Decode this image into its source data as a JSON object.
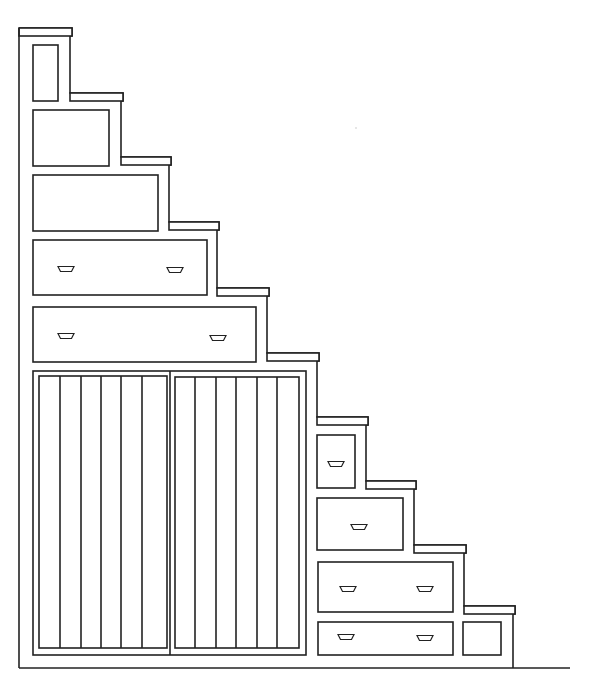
{
  "colors": {
    "line": "#222222",
    "background": "#ffffff"
  },
  "wall": {
    "x": 19,
    "y1": 28,
    "y2": 668
  },
  "floor": {
    "x1": 19,
    "x2": 570,
    "y": 668
  },
  "profile": [
    [
      19,
      28
    ],
    [
      72,
      28
    ],
    [
      72,
      36
    ],
    [
      70,
      36
    ],
    [
      70,
      93
    ],
    [
      123,
      93
    ],
    [
      123,
      101
    ],
    [
      121,
      101
    ],
    [
      121,
      157
    ],
    [
      171,
      157
    ],
    [
      171,
      165
    ],
    [
      169,
      165
    ],
    [
      169,
      222
    ],
    [
      219,
      222
    ],
    [
      219,
      230
    ],
    [
      217,
      230
    ],
    [
      217,
      288
    ],
    [
      269,
      288
    ],
    [
      269,
      296
    ],
    [
      267,
      296
    ],
    [
      267,
      353
    ],
    [
      319,
      353
    ],
    [
      319,
      361
    ],
    [
      317,
      361
    ],
    [
      317,
      417
    ],
    [
      368,
      417
    ],
    [
      368,
      425
    ],
    [
      366,
      425
    ],
    [
      366,
      481
    ],
    [
      416,
      481
    ],
    [
      416,
      489
    ],
    [
      414,
      489
    ],
    [
      414,
      545
    ],
    [
      466,
      545
    ],
    [
      466,
      553
    ],
    [
      464,
      553
    ],
    [
      464,
      606
    ],
    [
      515,
      606
    ],
    [
      515,
      614
    ],
    [
      513,
      614
    ],
    [
      513,
      668
    ]
  ],
  "treads": [
    [
      19,
      28,
      72,
      36
    ],
    [
      70,
      93,
      123,
      101
    ],
    [
      121,
      157,
      171,
      165
    ],
    [
      169,
      222,
      219,
      230
    ],
    [
      217,
      288,
      269,
      296
    ],
    [
      267,
      353,
      319,
      361
    ],
    [
      317,
      417,
      368,
      425
    ],
    [
      366,
      481,
      416,
      489
    ],
    [
      414,
      545,
      466,
      553
    ],
    [
      464,
      606,
      515,
      614
    ]
  ],
  "panels": [
    {
      "name": "top-cabinet-door",
      "x": 33,
      "y": 45,
      "w": 25,
      "h": 56,
      "handles": []
    },
    {
      "name": "drawer-2",
      "x": 33,
      "y": 110,
      "w": 76,
      "h": 56,
      "handles": []
    },
    {
      "name": "drawer-3",
      "x": 33,
      "y": 175,
      "w": 125,
      "h": 56,
      "handles": []
    },
    {
      "name": "drawer-4",
      "x": 33,
      "y": 240,
      "w": 174,
      "h": 55,
      "handles": [
        [
          66,
          269
        ],
        [
          175,
          270
        ]
      ]
    },
    {
      "name": "drawer-5",
      "x": 33,
      "y": 307,
      "w": 223,
      "h": 55,
      "handles": [
        [
          66,
          336
        ],
        [
          218,
          338
        ]
      ]
    },
    {
      "name": "right-drawer-1",
      "x": 317,
      "y": 435,
      "w": 38,
      "h": 53,
      "handles": [
        [
          336,
          464
        ]
      ]
    },
    {
      "name": "right-drawer-2",
      "x": 317,
      "y": 498,
      "w": 86,
      "h": 52,
      "handles": [
        [
          359,
          527
        ]
      ]
    },
    {
      "name": "right-drawer-3",
      "x": 318,
      "y": 562,
      "w": 135,
      "h": 50,
      "handles": [
        [
          348,
          589
        ],
        [
          425,
          589
        ]
      ]
    },
    {
      "name": "right-drawer-4",
      "x": 318,
      "y": 622,
      "w": 135,
      "h": 33,
      "handles": [
        [
          346,
          637
        ],
        [
          425,
          638
        ]
      ]
    },
    {
      "name": "small-end-door",
      "x": 463,
      "y": 622,
      "w": 38,
      "h": 33,
      "handles": []
    }
  ],
  "sliding_doors": {
    "frame": {
      "x": 33,
      "y": 371,
      "w": 273,
      "h": 284
    },
    "doors": [
      {
        "name": "left-sliding-door",
        "x": 39,
        "y": 376,
        "w": 128,
        "h": 272,
        "slats": [
          60,
          81,
          101,
          121,
          142
        ]
      },
      {
        "name": "right-sliding-door",
        "x": 175,
        "y": 377,
        "w": 124,
        "h": 271,
        "slats": [
          195,
          216,
          236,
          257,
          277
        ]
      }
    ]
  },
  "speck": {
    "x": 356,
    "y": 128
  }
}
